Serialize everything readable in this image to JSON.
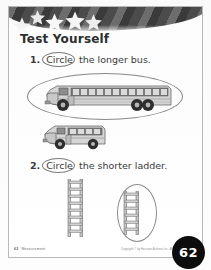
{
  "page": {
    "title": "Test Yourself",
    "page_number": "62",
    "footer_left_number": "62",
    "footer_left_label": "Measurement",
    "footer_right_credit": "Copyright © by Harcourt Achieve Inc. All rights reserved.",
    "ink_color": "#3a3a3a",
    "banner_color": "#4c4c4c",
    "badge_color": "#0d0d0d",
    "ring_color": "#8a8a8a"
  },
  "banner": {
    "star_count": 5,
    "star_color": "#f2f2f2",
    "stripe_colors": [
      "#4c4c4c",
      "#6e6e6e",
      "#3b3b3b"
    ]
  },
  "questions": [
    {
      "number": "1.",
      "verb": "Circle",
      "rest": "the longer bus.",
      "answer": "longer-bus",
      "items": [
        {
          "name": "long-school-bus",
          "relative_length": "longer",
          "circled": true
        },
        {
          "name": "short-school-bus",
          "relative_length": "shorter",
          "circled": false
        }
      ]
    },
    {
      "number": "2.",
      "verb": "Circle",
      "rest": "the shorter ladder.",
      "answer": "shorter-ladder",
      "items": [
        {
          "name": "tall-ladder",
          "rungs": 8,
          "relative_height": "taller",
          "circled": false
        },
        {
          "name": "short-ladder",
          "rungs": 6,
          "relative_height": "shorter",
          "circled": true
        }
      ]
    }
  ]
}
